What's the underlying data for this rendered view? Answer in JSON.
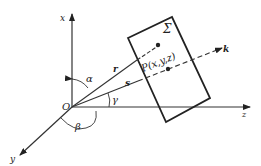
{
  "diagram": {
    "axes": {
      "x_label": "x",
      "y_label": "y",
      "z_label": "z",
      "origin_label": "O"
    },
    "plane_label": "Σ",
    "point_label": "P(x,y,z)",
    "vectors": {
      "r_label": "r",
      "s_label": "s",
      "k_label": "k"
    },
    "angles": {
      "alpha": "α",
      "beta": "β",
      "gamma": "γ"
    },
    "colors": {
      "line": "#222222",
      "background": "#ffffff"
    }
  }
}
